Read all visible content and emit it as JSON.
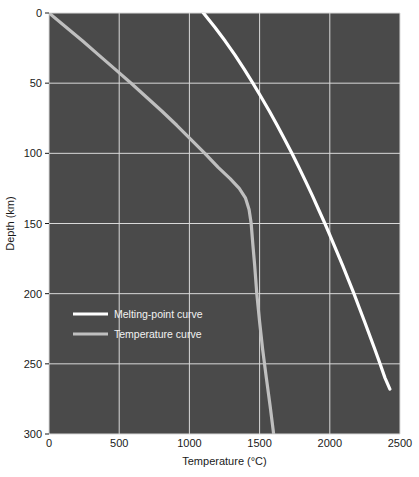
{
  "chart_data": {
    "type": "line",
    "title": "",
    "xlabel": "Temperature (°C)",
    "ylabel": "Depth (km)",
    "xlim": [
      0,
      2500
    ],
    "ylim": [
      0,
      300
    ],
    "y_inverted": true,
    "grid": true,
    "legend_position": "inside-lower-left",
    "plot_background": "#4a4a4a",
    "grid_color": "#d9d9d9",
    "xticks": [
      0,
      500,
      1000,
      1500,
      2000,
      2500
    ],
    "xtick_labels": [
      "0",
      "500",
      "1000",
      "1500",
      "2000",
      "2500"
    ],
    "yticks": [
      0,
      50,
      100,
      150,
      200,
      250,
      300
    ],
    "ytick_labels": [
      "0",
      "50",
      "100",
      "150",
      "200",
      "250",
      "300"
    ],
    "series": [
      {
        "name": "Melting-point curve",
        "color": "#ffffff",
        "width": 3.2,
        "points": [
          [
            1100,
            0
          ],
          [
            1180,
            10
          ],
          [
            1255,
            20
          ],
          [
            1325,
            30
          ],
          [
            1390,
            40
          ],
          [
            1452,
            50
          ],
          [
            1512,
            60
          ],
          [
            1570,
            70
          ],
          [
            1625,
            80
          ],
          [
            1678,
            90
          ],
          [
            1730,
            100
          ],
          [
            1780,
            110
          ],
          [
            1828,
            120
          ],
          [
            1875,
            130
          ],
          [
            1920,
            140
          ],
          [
            1965,
            150
          ],
          [
            2008,
            160
          ],
          [
            2050,
            170
          ],
          [
            2092,
            180
          ],
          [
            2132,
            190
          ],
          [
            2172,
            200
          ],
          [
            2210,
            210
          ],
          [
            2248,
            220
          ],
          [
            2285,
            230
          ],
          [
            2322,
            240
          ],
          [
            2358,
            250
          ],
          [
            2393,
            260
          ],
          [
            2428,
            268
          ]
        ]
      },
      {
        "name": "Temperature curve",
        "color": "#bfbfbf",
        "width": 3.2,
        "points": [
          [
            0,
            0
          ],
          [
            120,
            10
          ],
          [
            240,
            20
          ],
          [
            355,
            30
          ],
          [
            470,
            40
          ],
          [
            585,
            50
          ],
          [
            695,
            60
          ],
          [
            805,
            70
          ],
          [
            910,
            80
          ],
          [
            1010,
            90
          ],
          [
            1110,
            100
          ],
          [
            1205,
            110
          ],
          [
            1290,
            118
          ],
          [
            1355,
            125
          ],
          [
            1400,
            132
          ],
          [
            1425,
            140
          ],
          [
            1440,
            150
          ],
          [
            1452,
            165
          ],
          [
            1465,
            180
          ],
          [
            1480,
            200
          ],
          [
            1500,
            220
          ],
          [
            1522,
            240
          ],
          [
            1548,
            260
          ],
          [
            1575,
            280
          ],
          [
            1600,
            300
          ]
        ]
      }
    ],
    "legend": [
      {
        "label": "Melting-point curve",
        "color": "#ffffff"
      },
      {
        "label": "Temperature curve",
        "color": "#bfbfbf"
      }
    ]
  }
}
